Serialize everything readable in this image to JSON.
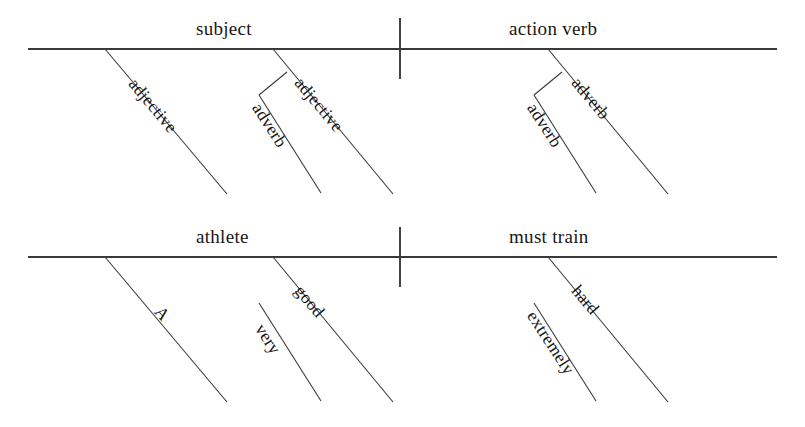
{
  "document": {
    "type": "reed-kellogg-sentence-diagram",
    "background_color": "#ffffff",
    "line_color": "#3a3a3a",
    "text_color": "#171717"
  },
  "diagrams": [
    {
      "id": "template",
      "name": "parts-of-speech-template",
      "baseline": {
        "x1": 28,
        "y1": 49,
        "x2": 777,
        "y2": 49
      },
      "divider": {
        "x": 400,
        "y1": 18,
        "y2": 79
      },
      "base_labels": [
        {
          "name": "subject",
          "text": "subject",
          "x": 196,
          "y": 18
        },
        {
          "name": "action-verb",
          "text": "action verb",
          "x": 509,
          "y": 18
        }
      ],
      "branches": [
        {
          "name": "subject-adjective-1",
          "text": "adjective",
          "line": {
            "x1": 105,
            "y1": 49,
            "x2": 227,
            "y2": 194
          },
          "label": {
            "x": 140,
            "y": 74,
            "angle": 50
          }
        },
        {
          "name": "subject-adjective-2",
          "text": "adjective",
          "line": {
            "x1": 273,
            "y1": 49,
            "x2": 393,
            "y2": 194
          },
          "label": {
            "x": 306,
            "y": 73,
            "angle": 50
          }
        },
        {
          "name": "subject-adverb",
          "text": "adverb",
          "line": {
            "x1": 259,
            "y1": 95,
            "x2": 321,
            "y2": 193
          },
          "connector": {
            "x1": 287,
            "y1": 72,
            "x2": 259,
            "y2": 95
          },
          "label": {
            "x": 265,
            "y": 99,
            "angle": 57
          }
        },
        {
          "name": "verb-adverb-1",
          "text": "adverb",
          "line": {
            "x1": 548,
            "y1": 49,
            "x2": 668,
            "y2": 194
          },
          "label": {
            "x": 583,
            "y": 73,
            "angle": 50
          }
        },
        {
          "name": "verb-adverb-2",
          "text": "adverb",
          "line": {
            "x1": 534,
            "y1": 95,
            "x2": 596,
            "y2": 193
          },
          "connector": {
            "x1": 562,
            "y1": 72,
            "x2": 534,
            "y2": 95
          },
          "label": {
            "x": 540,
            "y": 99,
            "angle": 57
          }
        }
      ]
    },
    {
      "id": "example",
      "name": "example-sentence",
      "sentence": "A very good athlete must train extremely hard",
      "baseline": {
        "x1": 28,
        "y1": 257,
        "x2": 777,
        "y2": 257
      },
      "divider": {
        "x": 400,
        "y1": 227,
        "y2": 287
      },
      "base_labels": [
        {
          "name": "subject-word",
          "text": "athlete",
          "x": 196,
          "y": 226
        },
        {
          "name": "verb-phrase",
          "text": "must train",
          "x": 509,
          "y": 226
        }
      ],
      "branches": [
        {
          "name": "article-a",
          "text": "A",
          "line": {
            "x1": 105,
            "y1": 257,
            "x2": 227,
            "y2": 402
          },
          "label": {
            "x": 166,
            "y": 302,
            "angle": 50
          }
        },
        {
          "name": "adjective-good",
          "text": "good",
          "line": {
            "x1": 273,
            "y1": 257,
            "x2": 393,
            "y2": 402
          },
          "label": {
            "x": 306,
            "y": 281,
            "angle": 50
          }
        },
        {
          "name": "adverb-very",
          "text": "very",
          "line": {
            "x1": 259,
            "y1": 303,
            "x2": 321,
            "y2": 401
          },
          "label": {
            "x": 268,
            "y": 320,
            "angle": 57
          }
        },
        {
          "name": "adverb-hard",
          "text": "hard",
          "line": {
            "x1": 548,
            "y1": 257,
            "x2": 668,
            "y2": 402
          },
          "label": {
            "x": 583,
            "y": 281,
            "angle": 50
          }
        },
        {
          "name": "adverb-extremely",
          "text": "extremely",
          "line": {
            "x1": 534,
            "y1": 303,
            "x2": 596,
            "y2": 401
          },
          "label": {
            "x": 540,
            "y": 307,
            "angle": 57
          }
        }
      ]
    }
  ]
}
